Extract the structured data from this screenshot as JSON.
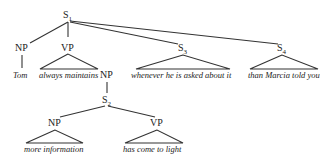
{
  "diagram": {
    "type": "syntax-tree",
    "nodes": {
      "s1": {
        "label": "S",
        "sub": "1"
      },
      "np_tom": {
        "label": "NP"
      },
      "vp_main": {
        "label": "VP"
      },
      "s3": {
        "label": "S",
        "sub": "3"
      },
      "s4": {
        "label": "S",
        "sub": "4"
      },
      "np_obj": {
        "label": "NP"
      },
      "s2": {
        "label": "S",
        "sub": "2"
      },
      "np_info": {
        "label": "NP"
      },
      "vp_light": {
        "label": "VP"
      }
    },
    "leaves": {
      "tom": "Tom",
      "always_maintains": "always maintains",
      "whenever": "whenever he is asked about it",
      "than_marcia": "than Marcia told you",
      "more_information": "more information",
      "has_come": "has come to light"
    }
  }
}
